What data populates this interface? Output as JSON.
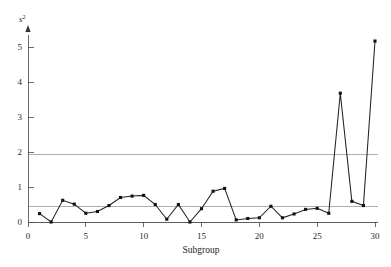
{
  "page": {
    "ghost_header": "",
    "background": "#ffffff"
  },
  "chart_data": {
    "type": "line",
    "title": "",
    "subtitle": "",
    "xlabel": "Subgroup",
    "ylabel": "s",
    "ylabel_superscript": "2",
    "xlim": [
      0,
      30
    ],
    "ylim": [
      0,
      5.4
    ],
    "xticks": [
      0,
      5,
      10,
      15,
      20,
      25,
      30
    ],
    "xtick_labels": [
      "0",
      "5",
      "10",
      "15",
      "20",
      "25",
      "30"
    ],
    "yticks": [
      0,
      1,
      2,
      3,
      4,
      5
    ],
    "ytick_labels": [
      "0",
      "1",
      "2",
      "3",
      "4",
      "5"
    ],
    "grid": false,
    "legend": false,
    "legend_position": "none",
    "marker": "square",
    "marker_color": "#111111",
    "line_color": "#222222",
    "control_line_color": "#9a9a9a",
    "axis_color": "#4a4a4a",
    "x": [
      1,
      2,
      3,
      4,
      5,
      6,
      7,
      8,
      9,
      10,
      11,
      12,
      13,
      14,
      15,
      16,
      17,
      18,
      19,
      20,
      21,
      22,
      23,
      24,
      25,
      26,
      27,
      28,
      29,
      30
    ],
    "values": [
      0.24,
      0.0,
      0.62,
      0.51,
      0.25,
      0.3,
      0.47,
      0.7,
      0.74,
      0.76,
      0.5,
      0.08,
      0.5,
      0.0,
      0.38,
      0.88,
      0.96,
      0.06,
      0.1,
      0.12,
      0.45,
      0.12,
      0.23,
      0.36,
      0.39,
      0.25,
      3.68,
      0.59,
      0.47,
      5.17
    ],
    "series": [
      {
        "name": "s2",
        "values": [
          0.24,
          0.0,
          0.62,
          0.51,
          0.25,
          0.3,
          0.47,
          0.7,
          0.74,
          0.76,
          0.5,
          0.08,
          0.5,
          0.0,
          0.38,
          0.88,
          0.96,
          0.06,
          0.1,
          0.12,
          0.45,
          0.12,
          0.23,
          0.36,
          0.39,
          0.25,
          3.68,
          0.59,
          0.47,
          5.17
        ]
      }
    ],
    "control_lines": [
      {
        "name": "UCL",
        "value": 1.93
      },
      {
        "name": "CL",
        "value": 0.43
      },
      {
        "name": "LCL",
        "value": 0.0
      }
    ],
    "annotations": []
  }
}
